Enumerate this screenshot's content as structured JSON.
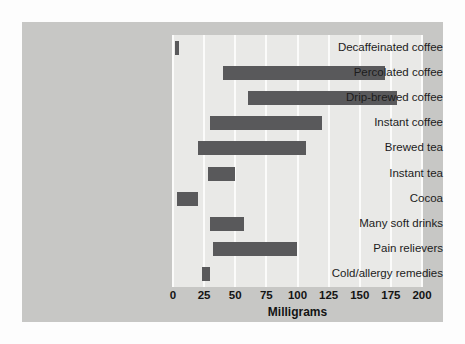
{
  "chart_data": {
    "type": "bar",
    "orientation": "horizontal",
    "bar_style": "range",
    "title": "",
    "subtitle": "",
    "xlabel": "Milligrams",
    "ylabel": "",
    "xlim": [
      0,
      200
    ],
    "xticks": [
      0,
      25,
      50,
      75,
      100,
      125,
      150,
      175,
      200
    ],
    "xticklabels": [
      "0",
      "25",
      "50",
      "75",
      "100",
      "125",
      "150",
      "175",
      "200"
    ],
    "grid": "vertical",
    "legend": "none",
    "categories": [
      "Decaffeinated coffee",
      "Percolated coffee",
      "Drip-brewed coffee",
      "Instant coffee",
      "Brewed tea",
      "Instant tea",
      "Cocoa",
      "Many soft drinks",
      "Pain relievers",
      "Cold/allergy remedies"
    ],
    "ranges": [
      {
        "category": "Decaffeinated coffee",
        "low": 2,
        "high": 5
      },
      {
        "category": "Percolated coffee",
        "low": 40,
        "high": 170
      },
      {
        "category": "Drip-brewed coffee",
        "low": 60,
        "high": 180
      },
      {
        "category": "Instant coffee",
        "low": 30,
        "high": 120
      },
      {
        "category": "Brewed tea",
        "low": 20,
        "high": 107
      },
      {
        "category": "Instant tea",
        "low": 28,
        "high": 50
      },
      {
        "category": "Cocoa",
        "low": 3,
        "high": 20
      },
      {
        "category": "Many soft drinks",
        "low": 30,
        "high": 57
      },
      {
        "category": "Pain relievers",
        "low": 32,
        "high": 100
      },
      {
        "category": "Cold/allergy remedies",
        "low": 23,
        "high": 30
      }
    ],
    "colors": {
      "bar": "#59595b",
      "plot_background": "#e9e9e7",
      "panel_background": "#c7c7c5",
      "gridline": "#fbfbfa",
      "text": "#1c1c1c"
    }
  }
}
